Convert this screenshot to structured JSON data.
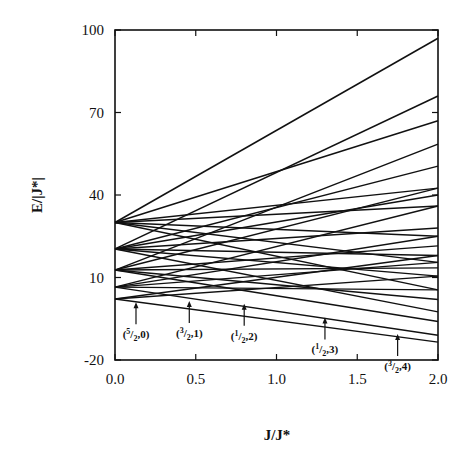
{
  "chart_data": {
    "type": "line",
    "title": "",
    "xlabel": "J/J*",
    "ylabel": "E/|J*|",
    "xlim": [
      0.0,
      2.0
    ],
    "ylim": [
      -20,
      100
    ],
    "x_ticks": [
      "0.0",
      "0.5",
      "1.0",
      "1.5",
      "2.0"
    ],
    "y_ticks": [
      "100",
      "70",
      "40",
      "10",
      "-20"
    ],
    "x_tick_values": [
      0,
      0.5,
      1.0,
      1.5,
      2.0
    ],
    "y_tick_values": [
      100,
      70,
      40,
      10,
      -20
    ],
    "grid": false,
    "legend": null,
    "series": [
      {
        "name": "level-30-a",
        "x": [
          0,
          2
        ],
        "y": [
          30,
          97
        ]
      },
      {
        "name": "level-30-b",
        "x": [
          0,
          2
        ],
        "y": [
          30,
          67
        ]
      },
      {
        "name": "level-30-c",
        "x": [
          0,
          2
        ],
        "y": [
          30,
          42.5
        ]
      },
      {
        "name": "level-30-d",
        "x": [
          0,
          2
        ],
        "y": [
          30,
          36
        ]
      },
      {
        "name": "level-30-e",
        "x": [
          0,
          2
        ],
        "y": [
          30,
          25
        ]
      },
      {
        "name": "level-30-f",
        "x": [
          0,
          2
        ],
        "y": [
          30,
          15.5
        ]
      },
      {
        "name": "level-30-g",
        "x": [
          0,
          2
        ],
        "y": [
          30,
          5.5
        ]
      },
      {
        "name": "level-20-a",
        "x": [
          0,
          2
        ],
        "y": [
          20.4,
          76
        ]
      },
      {
        "name": "level-20-b",
        "x": [
          0,
          2
        ],
        "y": [
          20.4,
          50.5
        ]
      },
      {
        "name": "level-20-c",
        "x": [
          0,
          2
        ],
        "y": [
          20.4,
          40
        ]
      },
      {
        "name": "level-20-d",
        "x": [
          0,
          2
        ],
        "y": [
          20.4,
          28
        ]
      },
      {
        "name": "level-20-e",
        "x": [
          0,
          2
        ],
        "y": [
          20.4,
          18
        ]
      },
      {
        "name": "level-20-f",
        "x": [
          0,
          2
        ],
        "y": [
          20.4,
          10.5
        ]
      },
      {
        "name": "level-20-g",
        "x": [
          0,
          2
        ],
        "y": [
          20.4,
          -2.5
        ]
      },
      {
        "name": "level-12-a",
        "x": [
          0,
          2
        ],
        "y": [
          12.7,
          58.5
        ]
      },
      {
        "name": "level-12-b",
        "x": [
          0,
          2
        ],
        "y": [
          12.7,
          42.5
        ]
      },
      {
        "name": "level-12-c",
        "x": [
          0,
          2
        ],
        "y": [
          12.7,
          21.5
        ]
      },
      {
        "name": "level-12-d",
        "x": [
          0,
          2
        ],
        "y": [
          12.7,
          13.5
        ]
      },
      {
        "name": "level-12-e",
        "x": [
          0,
          2
        ],
        "y": [
          12.7,
          2
        ]
      },
      {
        "name": "level-12-f",
        "x": [
          0,
          2
        ],
        "y": [
          12.7,
          -6
        ]
      },
      {
        "name": "level-6-a",
        "x": [
          0,
          2
        ],
        "y": [
          6.5,
          36
        ]
      },
      {
        "name": "level-6-b",
        "x": [
          0,
          2
        ],
        "y": [
          6.5,
          25
        ]
      },
      {
        "name": "level-6-c",
        "x": [
          0,
          2
        ],
        "y": [
          6.5,
          15.5
        ]
      },
      {
        "name": "level-6-d",
        "x": [
          0,
          2
        ],
        "y": [
          6.5,
          5.5
        ]
      },
      {
        "name": "level-6-e",
        "x": [
          0,
          2
        ],
        "y": [
          6.5,
          -11
        ]
      },
      {
        "name": "level-2-a",
        "x": [
          0,
          2
        ],
        "y": [
          2.2,
          18
        ]
      },
      {
        "name": "level-2-b",
        "x": [
          0,
          2
        ],
        "y": [
          2.2,
          10.5
        ]
      },
      {
        "name": "level-2-c",
        "x": [
          0,
          2
        ],
        "y": [
          2.2,
          -13.5
        ]
      }
    ],
    "annotations": [
      {
        "label_num": "5",
        "label_den": "2",
        "label_n": "0",
        "x": 0.13,
        "arrow_tip_y": 1.0,
        "text": "(5/2,0)"
      },
      {
        "label_num": "3",
        "label_den": "2",
        "label_n": "1",
        "x": 0.46,
        "arrow_tip_y": 1.5,
        "text": "(3/2,1)"
      },
      {
        "label_num": "1",
        "label_den": "2",
        "label_n": "2",
        "x": 0.8,
        "arrow_tip_y": 0.5,
        "text": "(1/2,2)"
      },
      {
        "label_num": "1",
        "label_den": "2",
        "label_n": "3",
        "x": 1.3,
        "arrow_tip_y": -4.5,
        "text": "(1/2,3)"
      },
      {
        "label_num": "3",
        "label_den": "2",
        "label_n": "4",
        "x": 1.75,
        "arrow_tip_y": -10.5,
        "text": "(3/2,4)"
      }
    ]
  }
}
